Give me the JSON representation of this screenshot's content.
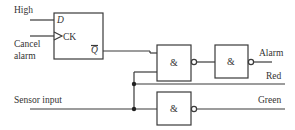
{
  "diagram": {
    "type": "logic-circuit",
    "flipflop": {
      "name": "D flip-flop",
      "pins": {
        "d": "D",
        "ck": "CK",
        "qbar": "Q"
      }
    },
    "inputs": {
      "high": "High",
      "cancel_line1": "Cancel",
      "cancel_line2": "alarm",
      "sensor": "Sensor input"
    },
    "gates": [
      {
        "id": "nand1",
        "symbol": "&"
      },
      {
        "id": "nand2",
        "symbol": "&"
      },
      {
        "id": "nand3",
        "symbol": "&"
      }
    ],
    "outputs": {
      "alarm": "Alarm",
      "red": "Red",
      "green": "Green"
    },
    "colors": {
      "line": "#3a3a3a",
      "text": "#333333",
      "background": "#ffffff"
    }
  }
}
